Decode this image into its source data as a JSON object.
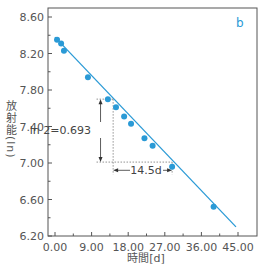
{
  "chart_data": {
    "type": "scatter",
    "title": "",
    "panel_label": "b",
    "xlabel": "時間[d]",
    "ylabel": "放射能(ln)",
    "xlim": [
      0,
      45
    ],
    "ylim": [
      6.2,
      8.6
    ],
    "x_ticks": [
      0,
      9,
      18,
      27,
      36,
      45
    ],
    "x_tick_labels": [
      "0.00",
      "9.00",
      "18.00",
      "27.00",
      "36.00",
      "45.00"
    ],
    "y_ticks": [
      6.2,
      6.6,
      7.0,
      7.4,
      7.8,
      8.2,
      8.6
    ],
    "y_tick_labels": [
      "6.20",
      "6.60",
      "7.00",
      "7.40",
      "7.80",
      "8.20",
      "8.60"
    ],
    "grid": false,
    "series": [
      {
        "name": "measured",
        "type": "scatter",
        "color": "#2a9ad6",
        "points": [
          {
            "x": 0.5,
            "y": 8.35
          },
          {
            "x": 1.5,
            "y": 8.31
          },
          {
            "x": 2.2,
            "y": 8.23
          },
          {
            "x": 8.1,
            "y": 7.94
          },
          {
            "x": 13.0,
            "y": 7.7
          },
          {
            "x": 15.0,
            "y": 7.61
          },
          {
            "x": 17.0,
            "y": 7.51
          },
          {
            "x": 18.7,
            "y": 7.43
          },
          {
            "x": 22.0,
            "y": 7.27
          },
          {
            "x": 24.0,
            "y": 7.19
          },
          {
            "x": 28.8,
            "y": 6.96
          },
          {
            "x": 39.0,
            "y": 6.52
          }
        ]
      },
      {
        "name": "fit",
        "type": "line",
        "color": "#2a9ad6",
        "points": [
          {
            "x": 0.0,
            "y": 8.38
          },
          {
            "x": 44.5,
            "y": 6.3
          }
        ]
      }
    ],
    "annotations": {
      "ln2_label": "ln 2=0.693",
      "halflife_label": "14.5d",
      "ln2_arrow": {
        "x": 11.2,
        "y_top": 7.7,
        "y_bottom": 7.01
      },
      "halflife_arrow": {
        "x_start": 14.3,
        "x_end": 28.8,
        "y": 6.92
      },
      "guide_lines": {
        "y_upper": 7.7,
        "y_lower": 7.01,
        "x_left": 14.3,
        "x_right": 28.8
      }
    }
  }
}
